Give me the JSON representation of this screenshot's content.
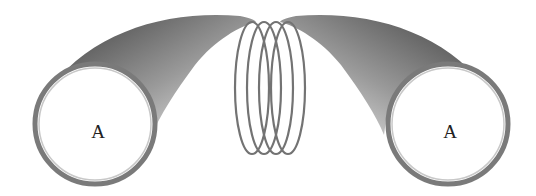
{
  "diagram": {
    "labels": {
      "left_tube": "A",
      "right_tube": "A"
    },
    "coil": {
      "turns": 4
    },
    "colors": {
      "background": "#ffffff",
      "outline": "#6b6b6b",
      "shade_dark": "#555555",
      "shade_light": "#f2f2f2",
      "label": "#222222"
    }
  }
}
